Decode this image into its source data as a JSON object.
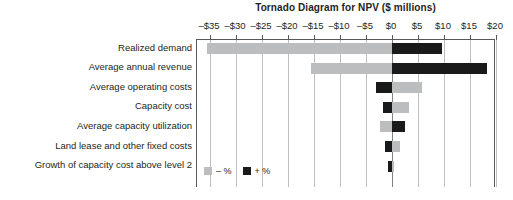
{
  "chart_data": {
    "type": "bar",
    "subtype": "tornado",
    "title": "Tornado Diagram for NPV ($ millions)",
    "xlabel": "",
    "ylabel": "",
    "xlim": [
      -37.5,
      20
    ],
    "xticks": [
      -35,
      -30,
      -25,
      -20,
      -15,
      -10,
      -5,
      0,
      5,
      10,
      15,
      20
    ],
    "xticklabels": [
      "–$35",
      "–$30",
      "–$25",
      "–$20",
      "–$15",
      "–$10",
      "–$5",
      "$0",
      "$5",
      "$10",
      "$15",
      "$20"
    ],
    "grid": true,
    "legend_position": "bottom-left",
    "baseline": 0,
    "categories": [
      "Realized demand",
      "Average annual revenue",
      "Average operating costs",
      "Capacity cost",
      "Average capacity utilization",
      "Land lease and other fixed costs",
      "Growth of capacity cost above level 2"
    ],
    "series": [
      {
        "name": "– %",
        "color": "#bcbdbf",
        "values": [
          -35.5,
          -15.5,
          5.8,
          3.3,
          -2.3,
          1.5,
          0.3
        ]
      },
      {
        "name": "+ %",
        "color": "#1a1a1a",
        "values": [
          9.6,
          18.3,
          -3.1,
          -1.7,
          2.5,
          -1.3,
          -0.8
        ]
      }
    ],
    "bars": [
      {
        "category": "Realized demand",
        "neg_start": -35.5,
        "neg_end": 0.0,
        "pos_start": 0.0,
        "pos_end": 9.6
      },
      {
        "category": "Average annual revenue",
        "neg_start": -15.5,
        "neg_end": 0.0,
        "pos_start": 0.0,
        "pos_end": 18.3
      },
      {
        "category": "Average operating costs",
        "neg_start": 0.0,
        "neg_end": 5.8,
        "pos_start": -3.1,
        "pos_end": 0.0
      },
      {
        "category": "Capacity cost",
        "neg_start": 0.0,
        "neg_end": 3.3,
        "pos_start": -1.7,
        "pos_end": 0.0
      },
      {
        "category": "Average capacity utilization",
        "neg_start": -2.3,
        "neg_end": 0.0,
        "pos_start": 0.0,
        "pos_end": 2.5
      },
      {
        "category": "Land lease and other fixed costs",
        "neg_start": 0.0,
        "neg_end": 1.5,
        "pos_start": -1.3,
        "pos_end": 0.0
      },
      {
        "category": "Growth of capacity cost above level 2",
        "neg_start": 0.0,
        "neg_end": 0.3,
        "pos_start": -0.8,
        "pos_end": 0.0
      }
    ],
    "legend": [
      {
        "label": "– %",
        "color": "#bcbdbf"
      },
      {
        "label": "+ %",
        "color": "#1a1a1a"
      }
    ],
    "colors": {
      "negative": "#bcbdbf",
      "positive": "#1a1a1a",
      "gridline": "#bcbec0",
      "axis": "#58595b",
      "text": "#231f20",
      "background": "#ffffff"
    }
  }
}
